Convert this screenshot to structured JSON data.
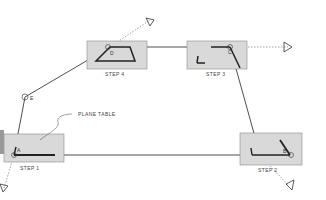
{
  "diagram": {
    "callout": "PLANE TABLE",
    "steps": [
      {
        "label": "STEP 1",
        "station": "A"
      },
      {
        "label": "STEP 2",
        "station": "B"
      },
      {
        "label": "STEP 3",
        "station": "C"
      },
      {
        "label": "STEP 4",
        "station": "D"
      }
    ],
    "extra_station": "E",
    "colors": {
      "table_fill": "#d9d9d9",
      "table_stroke": "#8a8a8a",
      "line": "#222222",
      "dotted": "#666666"
    }
  }
}
